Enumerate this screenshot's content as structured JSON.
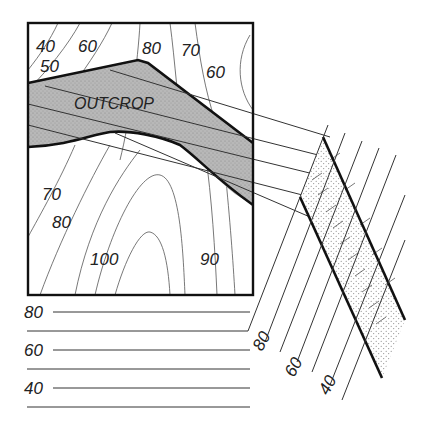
{
  "diagram": {
    "type": "geologic-map-and-cross-section",
    "map": {
      "outcrop_label": "OUTCROP",
      "contour_labels": [
        {
          "id": "c40",
          "text": "40",
          "x": 36,
          "y": 52
        },
        {
          "id": "c60a",
          "text": "60",
          "x": 78,
          "y": 52
        },
        {
          "id": "c50",
          "text": "50",
          "x": 40,
          "y": 72
        },
        {
          "id": "c80a",
          "text": "80",
          "x": 142,
          "y": 54
        },
        {
          "id": "c70a",
          "text": "70",
          "x": 181,
          "y": 56
        },
        {
          "id": "c60b",
          "text": "60",
          "x": 206,
          "y": 78
        },
        {
          "id": "c70b",
          "text": "70",
          "x": 42,
          "y": 200
        },
        {
          "id": "c80b",
          "text": "80",
          "x": 52,
          "y": 228
        },
        {
          "id": "c100",
          "text": "100",
          "x": 90,
          "y": 265
        },
        {
          "id": "c90",
          "text": "90",
          "x": 200,
          "y": 265
        }
      ],
      "colors": {
        "outcrop_fill": "#b8b8b8",
        "frame": "#111111"
      }
    },
    "elevation_scale": {
      "labels": [
        {
          "text": "80",
          "y": 314
        },
        {
          "text": "60",
          "y": 352
        },
        {
          "text": "40",
          "y": 390
        }
      ]
    },
    "section": {
      "labels": [
        {
          "text": "80",
          "x": 262,
          "y": 352,
          "rot": -62
        },
        {
          "text": "60",
          "x": 294,
          "y": 378,
          "rot": -62
        },
        {
          "text": "40",
          "x": 328,
          "y": 396,
          "rot": -62
        }
      ],
      "colors": {
        "stipple": "#888888"
      }
    }
  }
}
